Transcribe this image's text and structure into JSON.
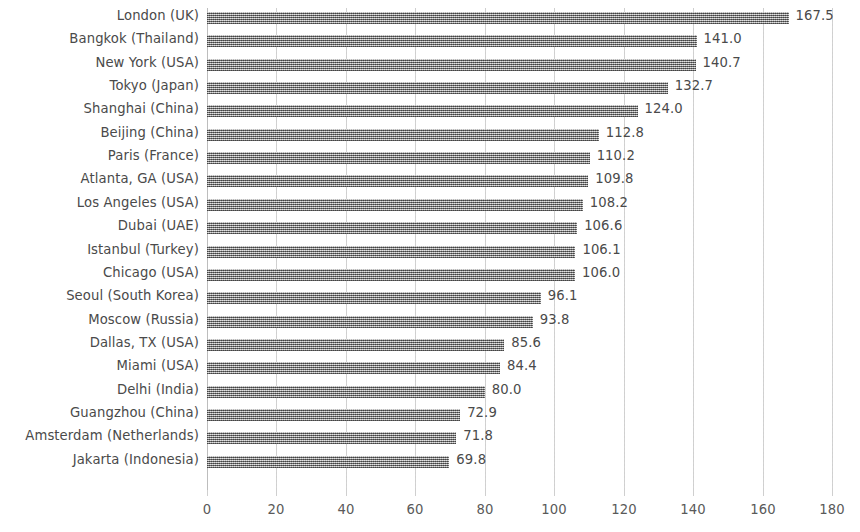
{
  "chart_data": {
    "type": "bar",
    "orientation": "horizontal",
    "title": "",
    "subtitle": "",
    "xlabel": "",
    "ylabel": "",
    "xlim": [
      0,
      180
    ],
    "xticks": [
      0,
      20,
      40,
      60,
      80,
      100,
      120,
      140,
      160,
      180
    ],
    "xtick_labels": [
      "0",
      "20",
      "40",
      "60",
      "80",
      "100",
      "120",
      "140",
      "160",
      "180"
    ],
    "grid": "vertical",
    "legend": null,
    "show_value_labels": true,
    "bar_color": "#8f8f8f",
    "text_color": "#4a4a4a",
    "gridline_color": "#cfcfcf",
    "categories": [
      "London (UK)",
      "Bangkok (Thailand)",
      "New York (USA)",
      "Tokyo (Japan)",
      "Shanghai (China)",
      "Beijing (China)",
      "Paris (France)",
      "Atlanta, GA (USA)",
      "Los Angeles (USA)",
      "Dubai (UAE)",
      "Istanbul (Turkey)",
      "Chicago (USA)",
      "Seoul (South Korea)",
      "Moscow (Russia)",
      "Dallas, TX (USA)",
      "Miami (USA)",
      "Delhi (India)",
      "Guangzhou (China)",
      "Amsterdam (Netherlands)",
      "Jakarta (Indonesia)"
    ],
    "values": [
      167.5,
      141.0,
      140.7,
      132.7,
      124.0,
      112.8,
      110.2,
      109.8,
      108.2,
      106.6,
      106.1,
      106.0,
      96.1,
      93.8,
      85.6,
      84.4,
      80.0,
      72.9,
      71.8,
      69.8
    ],
    "value_labels": [
      "167.5",
      "141.0",
      "140.7",
      "132.7",
      "124.0",
      "112.8",
      "110.2",
      "109.8",
      "108.2",
      "106.6",
      "106.1",
      "106.0",
      "96.1",
      "93.8",
      "85.6",
      "84.4",
      "80.0",
      "72.9",
      "71.8",
      "69.8"
    ]
  }
}
